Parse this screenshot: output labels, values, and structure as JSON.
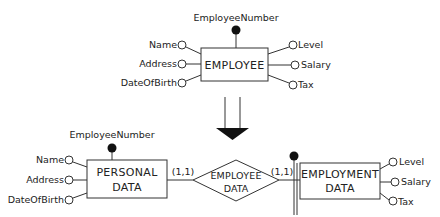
{
  "top_entity": {
    "name": "EMPLOYEE",
    "identifier": "EmployeeNumber",
    "left_attributes": [
      "Name",
      "Address",
      "DateOfBirth"
    ],
    "right_attributes": [
      "Level",
      "Salary",
      "Tax"
    ]
  },
  "transformation_arrow": "double-arrow-down",
  "bottom": {
    "left_entity": {
      "name_line1": "PERSONAL",
      "name_line2": "DATA",
      "identifier": "EmployeeNumber",
      "attributes": [
        "Name",
        "Address",
        "DateOfBirth"
      ]
    },
    "relationship": {
      "name_line1": "EMPLOYEE",
      "name_line2": "DATA",
      "left_cardinality": "(1,1)",
      "right_cardinality": "(1,1)"
    },
    "right_entity": {
      "name_line1": "EMPLOYMENT",
      "name_line2": "DATA",
      "attributes": [
        "Level",
        "Salary",
        "Tax"
      ],
      "external_identifier": true
    }
  },
  "colors": {
    "line": "#333333",
    "fill_dot": "#111111",
    "background": "#ffffff"
  }
}
